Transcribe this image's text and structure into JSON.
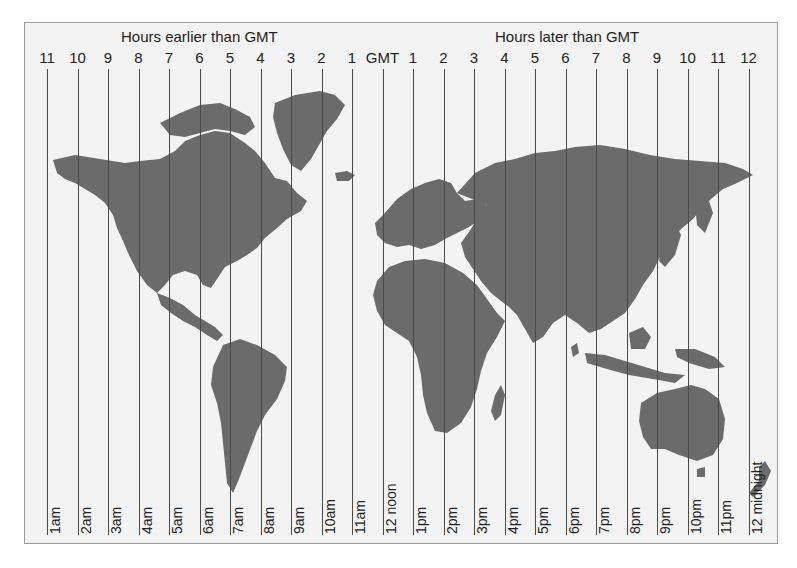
{
  "header": {
    "earlier_label": "Hours earlier than GMT",
    "later_label": "Hours later than GMT"
  },
  "colors": {
    "land": "#6b6b6b",
    "sea": "#f3f3f3",
    "line": "#4a4a4a",
    "frame": "#9a9a9a"
  },
  "zones": [
    {
      "offset": "11",
      "time": "1am"
    },
    {
      "offset": "10",
      "time": "2am"
    },
    {
      "offset": "9",
      "time": "3am"
    },
    {
      "offset": "8",
      "time": "4am"
    },
    {
      "offset": "7",
      "time": "5am"
    },
    {
      "offset": "6",
      "time": "6am"
    },
    {
      "offset": "5",
      "time": "7am"
    },
    {
      "offset": "4",
      "time": "8am"
    },
    {
      "offset": "3",
      "time": "9am"
    },
    {
      "offset": "2",
      "time": "10am"
    },
    {
      "offset": "1",
      "time": "11am"
    },
    {
      "offset": "GMT",
      "time": "12 noon"
    },
    {
      "offset": "1",
      "time": "1pm"
    },
    {
      "offset": "2",
      "time": "2pm"
    },
    {
      "offset": "3",
      "time": "3pm"
    },
    {
      "offset": "4",
      "time": "4pm"
    },
    {
      "offset": "5",
      "time": "5pm"
    },
    {
      "offset": "6",
      "time": "6pm"
    },
    {
      "offset": "7",
      "time": "7pm"
    },
    {
      "offset": "8",
      "time": "8pm"
    },
    {
      "offset": "9",
      "time": "9pm"
    },
    {
      "offset": "10",
      "time": "10pm"
    },
    {
      "offset": "11",
      "time": "11pm"
    },
    {
      "offset": "12",
      "time": "12 midnight"
    }
  ]
}
